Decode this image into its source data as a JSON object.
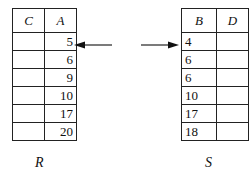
{
  "relations": [
    {
      "name": "R",
      "columns": [
        "C",
        "A"
      ],
      "rows": [
        [
          "",
          "5"
        ],
        [
          "",
          "6"
        ],
        [
          "",
          "9"
        ],
        [
          "",
          "10"
        ],
        [
          "",
          "17"
        ],
        [
          "",
          "20"
        ]
      ]
    },
    {
      "name": "S",
      "columns": [
        "B",
        "D"
      ],
      "rows": [
        [
          "4",
          ""
        ],
        [
          "6",
          ""
        ],
        [
          "6",
          ""
        ],
        [
          "10",
          ""
        ],
        [
          "17",
          ""
        ],
        [
          "18",
          ""
        ]
      ]
    }
  ],
  "arrows": [
    {
      "direction": "left",
      "points_to": "R row 1 (A=5)"
    },
    {
      "direction": "right",
      "points_to": "S row 1 (B=4)"
    }
  ]
}
